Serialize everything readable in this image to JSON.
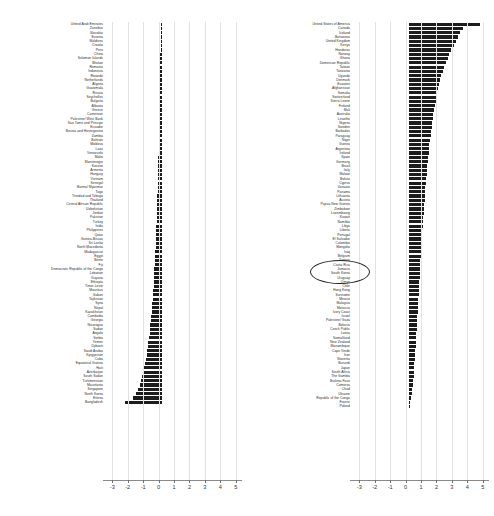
{
  "chart_data": {
    "type": "bar",
    "orientation": "horizontal",
    "title": "",
    "xlabel": "",
    "ylabel": "",
    "xlim": [
      -3.6,
      5.4
    ],
    "xticks": [
      -3,
      -2,
      -1,
      0,
      1,
      2,
      3,
      4,
      5
    ],
    "xtick_labels": [
      "-3",
      "-2",
      "-1",
      "0",
      "1",
      "2",
      "3",
      "4",
      "5"
    ],
    "grid": true,
    "grid_axis": "x",
    "legend": "none",
    "bar_color": "#1c1c1c",
    "panels": [
      {
        "name": "left-panel",
        "categories": [
          "United Arab Emirates",
          "Zanzibar",
          "Slovakia",
          "Estonia",
          "Maldives",
          "Croatia",
          "Peru",
          "China",
          "Solomon Islands",
          "Bhutan",
          "Romania",
          "Indonesia",
          "Rwanda",
          "Netherlands",
          "Algeria",
          "Guatemala",
          "Russia",
          "Seychelles",
          "Bulgaria",
          "Albania",
          "Greece",
          "Cameroon",
          "Palestine/ West Bank",
          "Sao Tome and Principe",
          "Ecuador",
          "Bosnia and Herzegovina",
          "Zambia",
          "Bahrain",
          "Moldova",
          "Laos",
          "Venezuela",
          "Malta",
          "Montenegro",
          "Kosovo",
          "Armenia",
          "Hungary",
          "Vietnam",
          "Senegal",
          "Burma/ Myanmar",
          "Togo",
          "Trinidad and Tobago",
          "Thailand",
          "Central African Republic",
          "Uzbekistan",
          "Jordan",
          "Pakistan",
          "Turkey",
          "India",
          "Philippines",
          "Qatar",
          "Guinea-Bissau",
          "Sri Lanka",
          "North Macedonia",
          "Madagascar",
          "Egypt",
          "Benin",
          "Fiji",
          "Democratic Republic of the Congo",
          "Lebanon",
          "Guyana",
          "Ethiopia",
          "Timor-Leste",
          "Mauritius",
          "Gabon",
          "Tajikistan",
          "Syria",
          "Nepal",
          "Kazakhstan",
          "Cambodia",
          "Georgia",
          "Nicaragua",
          "Sudan",
          "Angola",
          "Serbia",
          "Yemen",
          "Djibouti",
          "Saudi Arabia",
          "Kyrgyzstan",
          "Cuba",
          "Equatorial Guinea",
          "Haiti",
          "Azerbaijan",
          "South Sudan",
          "Turkmenistan",
          "Mauritania",
          "Singapore",
          "North Korea",
          "Eritrea",
          "Bangladesh"
        ],
        "values": [
          -0.04,
          -0.05,
          -0.05,
          -0.06,
          -0.06,
          -0.07,
          -0.07,
          -0.08,
          -0.08,
          -0.09,
          -0.09,
          -0.1,
          -0.1,
          -0.11,
          -0.11,
          -0.12,
          -0.12,
          -0.13,
          -0.13,
          -0.14,
          -0.14,
          -0.15,
          -0.15,
          -0.16,
          -0.16,
          -0.17,
          -0.18,
          -0.18,
          -0.19,
          -0.19,
          -0.2,
          -0.21,
          -0.21,
          -0.22,
          -0.23,
          -0.23,
          -0.24,
          -0.25,
          -0.26,
          -0.26,
          -0.27,
          -0.28,
          -0.29,
          -0.3,
          -0.31,
          -0.32,
          -0.33,
          -0.34,
          -0.35,
          -0.36,
          -0.37,
          -0.38,
          -0.39,
          -0.4,
          -0.42,
          -0.43,
          -0.44,
          -0.46,
          -0.47,
          -0.49,
          -0.5,
          -0.52,
          -0.54,
          -0.56,
          -0.58,
          -0.6,
          -0.62,
          -0.64,
          -0.67,
          -0.69,
          -0.72,
          -0.75,
          -0.78,
          -0.81,
          -0.85,
          -0.88,
          -0.92,
          -0.96,
          -1.01,
          -1.06,
          -1.12,
          -1.18,
          -1.25,
          -1.33,
          -1.42,
          -1.53,
          -1.66,
          -1.85,
          -2.35
        ]
      },
      {
        "name": "right-panel",
        "categories": [
          "United States of America",
          "Canada",
          "Iceland",
          "Botswana",
          "United Kingdom",
          "Kenya",
          "Honduras",
          "Norway",
          "Ghana",
          "Dominican Republic",
          "Taiwan",
          "Tanzania",
          "Uganda",
          "Denmark",
          "Eswatini",
          "Afghanistan",
          "Somalia",
          "Switzerland",
          "Sierra Leone",
          "Finland",
          "Mali",
          "Australia",
          "Lesotho",
          "Nigeria",
          "Sweden",
          "Barbados",
          "Paraguay",
          "Niger",
          "Guinea",
          "Argentina",
          "Ireland",
          "Spain",
          "Germany",
          "Brazil",
          "Italy",
          "Malawi",
          "Bolivia",
          "Cyprus",
          "Vanuatu",
          "Panama",
          "Lithuania",
          "Austria",
          "Papua New Guinea",
          "Zimbabwe",
          "Luxembourg",
          "Kuwait",
          "Namibia",
          "Libya",
          "Liberia",
          "Portugal",
          "El Salvador",
          "Colombia",
          "Mongolia",
          "Iraq",
          "Belgium",
          "Tunisia",
          "Costa Rica",
          "Jamaica",
          "South Korea",
          "Uruguay",
          "Oman",
          "Chile",
          "Hong Kong",
          "Suriname",
          "Mexico",
          "Malaysia",
          "Morocco",
          "Ivory Coast",
          "Israel",
          "Palestine/ Gaza",
          "Belarus",
          "Czech Public",
          "Latvia",
          "Somaliland",
          "New Zealand",
          "Mozambique",
          "Cape Verde",
          "Iran",
          "Slovenia",
          "Burundi",
          "Japan",
          "South Africa",
          "The Gambia",
          "Burkina Faso",
          "Comoros",
          "Chad",
          "Ukraine",
          "Republic of the Congo",
          "France",
          "Poland"
        ],
        "values": [
          4.62,
          3.55,
          3.3,
          3.18,
          3.05,
          2.95,
          2.72,
          2.6,
          2.52,
          2.4,
          2.28,
          2.2,
          2.12,
          2.05,
          1.98,
          1.92,
          1.86,
          1.8,
          1.75,
          1.7,
          1.65,
          1.61,
          1.57,
          1.53,
          1.49,
          1.45,
          1.42,
          1.38,
          1.35,
          1.32,
          1.29,
          1.26,
          1.23,
          1.21,
          1.18,
          1.16,
          1.13,
          1.11,
          1.09,
          1.07,
          1.05,
          1.03,
          1.01,
          0.99,
          0.97,
          0.95,
          0.93,
          0.91,
          0.89,
          0.87,
          0.86,
          0.84,
          0.82,
          0.81,
          0.79,
          0.77,
          0.76,
          0.74,
          0.72,
          0.71,
          0.69,
          0.68,
          0.66,
          0.65,
          0.63,
          0.62,
          0.6,
          0.59,
          0.57,
          0.55,
          0.54,
          0.52,
          0.51,
          0.49,
          0.47,
          0.46,
          0.44,
          0.42,
          0.4,
          0.38,
          0.36,
          0.34,
          0.32,
          0.29,
          0.27,
          0.24,
          0.21,
          0.17,
          0.12,
          0.06
        ]
      }
    ],
    "annotations": [
      {
        "type": "ellipse",
        "name": "highlight-ellipse",
        "panel": "right-panel",
        "encircles": [
          "Costa Rica",
          "Jamaica",
          "South Korea",
          "Uruguay"
        ]
      }
    ]
  }
}
